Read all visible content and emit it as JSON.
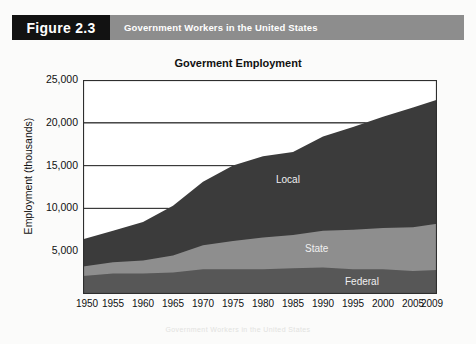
{
  "header": {
    "figure_tab": "Figure 2.3",
    "figure_title": "Government Workers in the United States"
  },
  "chart_data": {
    "type": "area",
    "title": "Goverment Employment",
    "xlabel": "",
    "ylabel": "Employment (thousands)",
    "stacked": true,
    "grid": true,
    "legend_position": "inline-labels",
    "xlim": [
      1950,
      2009
    ],
    "ylim": [
      0,
      25000
    ],
    "yticks": [
      "5,000",
      "10,000",
      "15,000",
      "20,000",
      "25,000"
    ],
    "ytick_values": [
      5000,
      10000,
      15000,
      20000,
      25000
    ],
    "xticks": [
      "1950",
      "1955",
      "1960",
      "1965",
      "1970",
      "1975",
      "1980",
      "1985",
      "1990",
      "1995",
      "2000",
      "2005",
      "2009"
    ],
    "xtick_values": [
      1950,
      1955,
      1960,
      1965,
      1970,
      1975,
      1980,
      1985,
      1990,
      1995,
      2000,
      2005,
      2009
    ],
    "x": [
      1950,
      1955,
      1960,
      1965,
      1970,
      1975,
      1980,
      1985,
      1990,
      1995,
      2000,
      2005,
      2009
    ],
    "series": [
      {
        "name": "Federal",
        "color": "#575757",
        "values": [
          2100,
          2400,
          2400,
          2500,
          2900,
          2900,
          2900,
          3000,
          3100,
          2900,
          2900,
          2700,
          2800
        ]
      },
      {
        "name": "State",
        "color": "#8e8e8e",
        "values": [
          1100,
          1300,
          1500,
          2000,
          2800,
          3300,
          3700,
          3900,
          4300,
          4600,
          4800,
          5100,
          5400
        ]
      },
      {
        "name": "Local",
        "color": "#3b3b3b",
        "values": [
          3200,
          3700,
          4500,
          5800,
          7400,
          8800,
          9500,
          9700,
          11000,
          12000,
          13000,
          14000,
          14500
        ]
      }
    ],
    "totals": [
      6400,
      7400,
      8400,
      10300,
      13100,
      15000,
      16100,
      16600,
      18400,
      19500,
      20700,
      21800,
      22700
    ]
  },
  "bleed_text": "Government Workers in the United States"
}
